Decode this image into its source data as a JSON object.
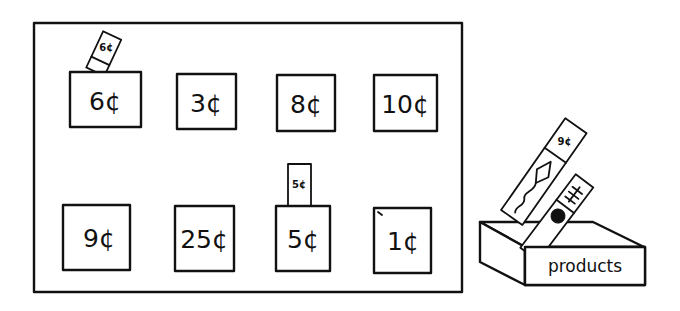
{
  "board": {
    "price_boxes": [
      {
        "label": "6¢"
      },
      {
        "label": "3¢"
      },
      {
        "label": "8¢"
      },
      {
        "label": "10¢"
      },
      {
        "label": "9¢"
      },
      {
        "label": "25¢"
      },
      {
        "label": "5¢"
      },
      {
        "label": "1¢"
      }
    ],
    "inserted_cards": [
      {
        "label": "6¢",
        "slot": "6¢"
      },
      {
        "label": "5¢",
        "slot": "5¢"
      }
    ]
  },
  "products_box": {
    "label": "products",
    "cards": [
      {
        "price": "9¢",
        "picture": "kite-icon"
      },
      {
        "price": "",
        "picture": "bug-icon"
      }
    ]
  },
  "colors": {
    "ink": "#111111",
    "paper": "#ffffff"
  }
}
